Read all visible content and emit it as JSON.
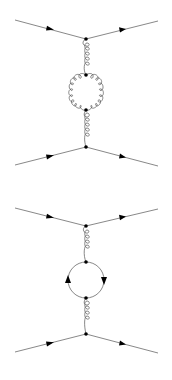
{
  "figure": {
    "colors": {
      "line": "#7a7a7a",
      "gluon": "#555555",
      "vertex": "#000000",
      "background": "#ffffff"
    },
    "diagrams": [
      {
        "id": "gluon-loop",
        "loop_type": "gluon",
        "top_vertex": [
          86,
          39
        ],
        "bottom_vertex": [
          86,
          147
        ],
        "loop_center": [
          86,
          92
        ],
        "loop_radius": 17,
        "loop_top_vertex": [
          86,
          75
        ],
        "loop_bottom_vertex": [
          86,
          110
        ],
        "fermion_lines": [
          {
            "from": [
              15,
              20
            ],
            "to": [
              86,
              39
            ],
            "arrow": "in"
          },
          {
            "from": [
              86,
              39
            ],
            "to": [
              158,
              21
            ],
            "arrow": "out"
          },
          {
            "from": [
              15,
              165
            ],
            "to": [
              86,
              147
            ],
            "arrow": "in"
          },
          {
            "from": [
              86,
              147
            ],
            "to": [
              158,
              166
            ],
            "arrow": "out"
          }
        ]
      },
      {
        "id": "quark-loop",
        "loop_type": "fermion",
        "top_vertex": [
          86,
          226
        ],
        "bottom_vertex": [
          86,
          334
        ],
        "loop_center": [
          86,
          280
        ],
        "loop_radius": 18,
        "loop_top_vertex": [
          86,
          262
        ],
        "loop_bottom_vertex": [
          86,
          298
        ],
        "loop_arrows": [
          "left-up",
          "right-down"
        ],
        "fermion_lines": [
          {
            "from": [
              15,
              208
            ],
            "to": [
              86,
              226
            ],
            "arrow": "in"
          },
          {
            "from": [
              86,
              226
            ],
            "to": [
              158,
              209
            ],
            "arrow": "out"
          },
          {
            "from": [
              15,
              352
            ],
            "to": [
              86,
              334
            ],
            "arrow": "in"
          },
          {
            "from": [
              86,
              334
            ],
            "to": [
              158,
              353
            ],
            "arrow": "out"
          }
        ]
      }
    ]
  }
}
